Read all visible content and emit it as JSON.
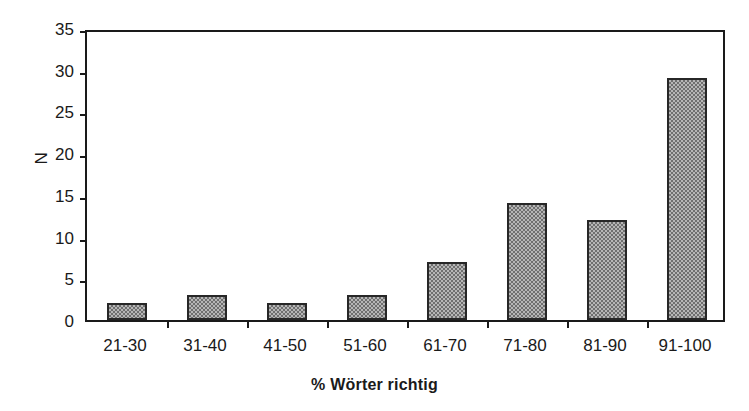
{
  "chart_data": {
    "type": "bar",
    "title": "",
    "xlabel": "% Wörter richtig",
    "ylabel": "N",
    "categories": [
      "21-30",
      "31-40",
      "41-50",
      "51-60",
      "61-70",
      "71-80",
      "81-90",
      "91-100"
    ],
    "values": [
      2,
      3,
      2,
      3,
      7,
      14,
      12,
      29
    ],
    "series": [
      {
        "name": "N",
        "values": [
          2,
          3,
          2,
          3,
          7,
          14,
          12,
          29
        ]
      }
    ],
    "ylim": [
      0,
      35
    ],
    "y_ticks": [
      0,
      5,
      10,
      15,
      20,
      25,
      30,
      35
    ],
    "y_tick_labels": [
      "0",
      "5",
      "10",
      "15",
      "20",
      "25",
      "30",
      "35"
    ],
    "grid": false,
    "legend": false,
    "legend_position": "none",
    "colors": {
      "bar_fill": "#b6b6b6",
      "bar_pattern": "#6f6f6f",
      "bar_border": "#272727",
      "axis": "#1a1a1a",
      "background": "#ffffff",
      "text": "#1a1a1a"
    }
  }
}
